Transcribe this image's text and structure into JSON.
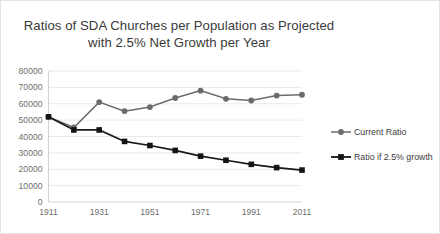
{
  "chart_data": {
    "type": "line",
    "title": "Ratios of SDA Churches per Population as Projected with 2.5% Net Growth per Year",
    "title_line1": "Ratios of SDA Churches per Population as Projected",
    "title_line2": "with 2.5% Net Growth per Year",
    "xlabel": "",
    "ylabel": "",
    "x": [
      1911,
      1921,
      1931,
      1941,
      1951,
      1961,
      1971,
      1981,
      1991,
      2001,
      2011
    ],
    "xtick_labels": [
      "1911",
      "1931",
      "1951",
      "1971",
      "1991",
      "2011"
    ],
    "xtick_values": [
      1911,
      1931,
      1951,
      1971,
      1991,
      2011
    ],
    "ytick_labels": [
      "0",
      "10000",
      "20000",
      "30000",
      "40000",
      "50000",
      "60000",
      "70000",
      "80000"
    ],
    "ytick_values": [
      0,
      10000,
      20000,
      30000,
      40000,
      50000,
      60000,
      70000,
      80000
    ],
    "xlim": [
      1911,
      2011
    ],
    "ylim": [
      0,
      80000
    ],
    "grid": true,
    "legend_position": "right",
    "series": [
      {
        "name": "Current Ratio",
        "marker": "circle",
        "color": "#6b6b6b",
        "values": [
          52000,
          45500,
          61000,
          55500,
          58000,
          63500,
          68000,
          63000,
          62000,
          65000,
          65500
        ]
      },
      {
        "name": "Ratio if 2.5% growth",
        "marker": "square",
        "color": "#141414",
        "values": [
          52000,
          44000,
          44000,
          37000,
          34500,
          31500,
          28000,
          25500,
          23000,
          21000,
          19500
        ]
      }
    ]
  },
  "legend": {
    "items": [
      {
        "label": "Current Ratio"
      },
      {
        "label": "Ratio if 2.5% growth"
      }
    ]
  }
}
